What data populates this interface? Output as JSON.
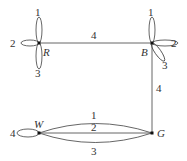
{
  "diagram": {
    "type": "multigraph",
    "vertices": [
      {
        "id": "R",
        "label": "R"
      },
      {
        "id": "B",
        "label": "B"
      },
      {
        "id": "G",
        "label": "G"
      },
      {
        "id": "W",
        "label": "W"
      }
    ],
    "edges": [
      {
        "from": "R",
        "to": "R",
        "label": "1",
        "kind": "loop"
      },
      {
        "from": "R",
        "to": "R",
        "label": "2",
        "kind": "loop"
      },
      {
        "from": "R",
        "to": "R",
        "label": "3",
        "kind": "loop"
      },
      {
        "from": "R",
        "to": "B",
        "label": "4",
        "kind": "straight"
      },
      {
        "from": "B",
        "to": "B",
        "label": "1",
        "kind": "loop"
      },
      {
        "from": "B",
        "to": "B",
        "label": "2",
        "kind": "loop"
      },
      {
        "from": "B",
        "to": "B",
        "label": "3",
        "kind": "loop"
      },
      {
        "from": "B",
        "to": "G",
        "label": "4",
        "kind": "straight"
      },
      {
        "from": "W",
        "to": "G",
        "label": "1",
        "kind": "curved-up"
      },
      {
        "from": "W",
        "to": "G",
        "label": "2",
        "kind": "straight"
      },
      {
        "from": "W",
        "to": "G",
        "label": "3",
        "kind": "curved-down"
      },
      {
        "from": "W",
        "to": "W",
        "label": "4",
        "kind": "loop"
      }
    ]
  }
}
